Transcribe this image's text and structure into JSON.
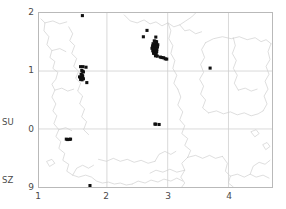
{
  "figure": {
    "title": "",
    "background_color": "#ffffff",
    "frame_color": "#b9b9b9",
    "grid_color": "#cfcfcf",
    "coast_color": "#c8c8c8",
    "point_color": "#101010",
    "text_color": "#4a4a4a"
  },
  "axes": {
    "x_ticks": [
      "1",
      "2",
      "3",
      "4"
    ],
    "y_ticks": [
      "2",
      "1",
      "0",
      "9"
    ],
    "y_side_labels": [
      {
        "label": "SU",
        "at_tick": "0"
      },
      {
        "label": "SZ",
        "at_tick": "9"
      }
    ],
    "x_label": "",
    "y_label": ""
  },
  "chart_data": {
    "type": "scatter",
    "title": "",
    "xlabel": "",
    "ylabel": "",
    "xlim": [
      0.88,
      4.72
    ],
    "ylim": [
      -1.0,
      2.0
    ],
    "grid": true,
    "legend": null,
    "xticks": [
      1,
      2,
      3,
      4
    ],
    "xticklabels": [
      "1",
      "2",
      "3",
      "4"
    ],
    "yticks": [
      2,
      1,
      0,
      -1
    ],
    "yticklabels": [
      "2",
      "1",
      "0",
      "9"
    ],
    "series": [
      {
        "name": "records",
        "marker": "square",
        "color": "#101010",
        "points": [
          [
            1.595,
            1.955
          ],
          [
            1.565,
            1.075
          ],
          [
            1.605,
            1.075
          ],
          [
            1.655,
            1.065
          ],
          [
            1.585,
            1.01
          ],
          [
            1.6,
            0.995
          ],
          [
            1.612,
            0.985
          ],
          [
            1.575,
            0.945
          ],
          [
            1.592,
            0.93
          ],
          [
            1.6,
            0.912
          ],
          [
            1.548,
            0.898
          ],
          [
            1.566,
            0.893
          ],
          [
            1.585,
            0.885
          ],
          [
            1.596,
            0.872
          ],
          [
            1.612,
            0.866
          ],
          [
            1.566,
            0.855
          ],
          [
            1.59,
            0.848
          ],
          [
            1.668,
            0.8
          ],
          [
            2.66,
            1.7
          ],
          [
            2.6,
            1.59
          ],
          [
            2.805,
            1.585
          ],
          [
            2.78,
            1.52
          ],
          [
            2.8,
            1.51
          ],
          [
            2.818,
            1.505
          ],
          [
            2.76,
            1.47
          ],
          [
            2.78,
            1.465
          ],
          [
            2.8,
            1.462
          ],
          [
            2.82,
            1.458
          ],
          [
            2.838,
            1.452
          ],
          [
            2.752,
            1.432
          ],
          [
            2.772,
            1.428
          ],
          [
            2.792,
            1.424
          ],
          [
            2.812,
            1.42
          ],
          [
            2.832,
            1.415
          ],
          [
            2.742,
            1.392
          ],
          [
            2.762,
            1.388
          ],
          [
            2.782,
            1.384
          ],
          [
            2.802,
            1.38
          ],
          [
            2.822,
            1.376
          ],
          [
            2.755,
            1.348
          ],
          [
            2.778,
            1.344
          ],
          [
            2.8,
            1.34
          ],
          [
            2.82,
            1.336
          ],
          [
            2.768,
            1.305
          ],
          [
            2.79,
            1.3
          ],
          [
            2.812,
            1.296
          ],
          [
            2.8,
            1.262
          ],
          [
            2.83,
            1.256
          ],
          [
            2.88,
            1.24
          ],
          [
            2.905,
            1.232
          ],
          [
            2.935,
            1.228
          ],
          [
            2.96,
            1.21
          ],
          [
            2.985,
            1.205
          ],
          [
            3.7,
            1.05
          ],
          [
            2.79,
            0.085
          ],
          [
            2.805,
            0.082
          ],
          [
            2.86,
            0.078
          ],
          [
            1.33,
            -0.175
          ],
          [
            1.352,
            -0.182
          ],
          [
            1.382,
            -0.178
          ],
          [
            1.4,
            -0.175
          ],
          [
            1.72,
            -0.975
          ]
        ]
      }
    ],
    "annotations": [
      {
        "text": "SU",
        "position": "y-axis side label at y=0"
      },
      {
        "text": "SZ",
        "position": "y-axis side label at y=-1"
      }
    ]
  }
}
